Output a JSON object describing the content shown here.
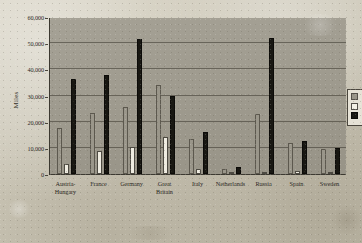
{
  "chart_data": {
    "type": "bar",
    "title": "",
    "xlabel": "",
    "ylabel": "Miles",
    "ylim": [
      0,
      60000
    ],
    "yticks": [
      0,
      10000,
      20000,
      30000,
      40000,
      50000,
      60000
    ],
    "ytick_labels": [
      "0",
      "10,000",
      "20,000",
      "30,000",
      "40,000",
      "50,000",
      "60,000"
    ],
    "grid": true,
    "legend_position": "right",
    "categories": [
      "Austria-Hungary",
      "France",
      "Germany",
      "Great Britain",
      "Italy",
      "Netherlands",
      "Russia",
      "Spain",
      "Sweden"
    ],
    "category_lines": [
      [
        "Austria-",
        "Hungary"
      ],
      [
        "France"
      ],
      [
        "Germany"
      ],
      [
        "Great",
        "Britain"
      ],
      [
        "Italy"
      ],
      [
        "Netherlands"
      ],
      [
        "Russia"
      ],
      [
        "Spain"
      ],
      [
        "Sweden"
      ]
    ],
    "series": [
      {
        "name": "",
        "swatch": "s0",
        "color": "#9a968a",
        "values": [
          17500,
          23500,
          25500,
          34000,
          13500,
          2000,
          23000,
          12000,
          9500
        ]
      },
      {
        "name": "",
        "swatch": "s1",
        "color": "#efece1",
        "values": [
          4000,
          8800,
          10500,
          14000,
          1800,
          700,
          900,
          1100,
          600
        ]
      },
      {
        "name": "",
        "swatch": "s2",
        "color": "#181712",
        "values": [
          36500,
          38000,
          51500,
          30000,
          16000,
          2500,
          52000,
          12500,
          9800
        ]
      }
    ],
    "legend_entries": [
      {
        "swatch": "s0",
        "label": ""
      },
      {
        "swatch": "s1",
        "label": ""
      },
      {
        "swatch": "s2",
        "label": ""
      }
    ]
  }
}
